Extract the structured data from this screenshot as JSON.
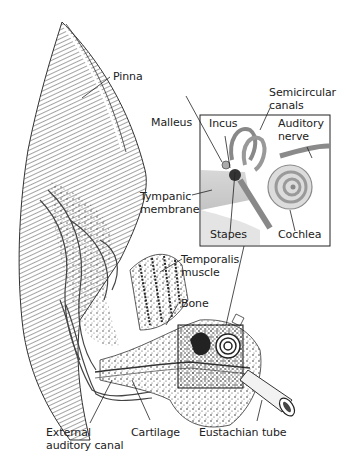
{
  "diagram": {
    "colors": {
      "ink": "#222222",
      "background": "#ffffff",
      "shade": "#9a9a9a"
    },
    "labels": [
      {
        "id": "pinna",
        "text": "Pinna"
      },
      {
        "id": "semicircular-canals",
        "text": "Semicircular\ncanals"
      },
      {
        "id": "malleus",
        "text": "Malleus"
      },
      {
        "id": "incus",
        "text": "Incus"
      },
      {
        "id": "auditory-nerve",
        "text": "Auditory\nnerve"
      },
      {
        "id": "tympanic-membrane",
        "text": "Tympanic\nmembrane"
      },
      {
        "id": "stapes",
        "text": "Stapes"
      },
      {
        "id": "cochlea",
        "text": "Cochlea"
      },
      {
        "id": "temporalis-muscle",
        "text": "Temporalis\nmuscle"
      },
      {
        "id": "bone",
        "text": "Bone"
      },
      {
        "id": "external-auditory-canal",
        "text": "External\nauditory canal"
      },
      {
        "id": "cartilage",
        "text": "Cartilage"
      },
      {
        "id": "eustachian-tube",
        "text": "Eustachian tube"
      }
    ]
  }
}
